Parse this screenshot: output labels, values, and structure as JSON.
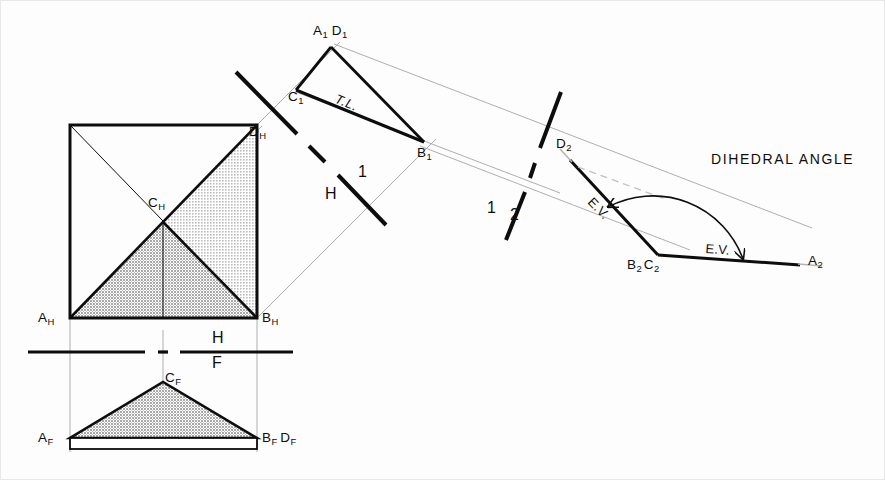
{
  "figure": {
    "type": "descriptive-geometry-drawing",
    "colors": {
      "ink": "#0d0d0d",
      "thin_line": "#999999",
      "shade_light": "#c9c9c9",
      "shade_dark": "#b0b0b0",
      "background": "#fdfdfd"
    }
  },
  "top_view": {
    "name": "horizontal-view",
    "labels": {
      "a": "A",
      "a_sub": "H",
      "b": "B",
      "b_sub": "H",
      "c": "C",
      "c_sub": "H",
      "d": "D",
      "d_sub": "H"
    },
    "square": {
      "x1": 70,
      "y1": 125,
      "x2": 257,
      "y2": 318
    },
    "center": {
      "x": 163,
      "y": 222
    }
  },
  "front_view": {
    "name": "frontal-view",
    "labels": {
      "a": "A",
      "a_sub": "F",
      "bd": "B",
      "bd_sub": "F",
      "bd2": "D",
      "bd2_sub": "F",
      "c": "C",
      "c_sub": "F"
    },
    "apex": {
      "x": 163,
      "y": 382
    },
    "base_left": {
      "x": 70,
      "y": 438
    },
    "base_right": {
      "x": 257,
      "y": 438
    }
  },
  "fold_lines": {
    "hf": {
      "label_top": "H",
      "label_bottom": "F",
      "y": 352
    },
    "h1": {
      "label_left": "H",
      "label_right": "1"
    },
    "one_two": {
      "label_left": "1",
      "label_right": "2"
    }
  },
  "aux_view_1": {
    "name": "first-auxiliary-view",
    "labels": {
      "ad": "A",
      "ad_sub": "1",
      "ad2": "D",
      "ad2_sub": "1",
      "b": "B",
      "b_sub": "1",
      "c": "C",
      "c_sub": "1"
    },
    "annotation": "T.L.",
    "points": {
      "a1d1": {
        "x": 331,
        "y": 47
      },
      "c1": {
        "x": 296,
        "y": 90
      },
      "b1": {
        "x": 424,
        "y": 142
      }
    }
  },
  "aux_view_2": {
    "name": "second-auxiliary-view",
    "labels": {
      "d": "D",
      "d_sub": "2",
      "bc": "B",
      "bc_sub": "2",
      "bc2": "C",
      "bc2_sub": "2",
      "a": "A",
      "a_sub": "2"
    },
    "annotations": {
      "edge_view_1": "E.V.",
      "edge_view_2": "E.V.",
      "dihedral": "DIHEDRAL  ANGLE"
    },
    "points": {
      "d2": {
        "x": 570,
        "y": 160
      },
      "b2c2": {
        "x": 658,
        "y": 255
      },
      "a2": {
        "x": 800,
        "y": 265
      }
    }
  }
}
